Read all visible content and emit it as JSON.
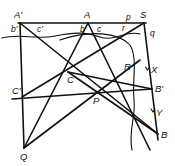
{
  "diagram": {
    "points": {
      "A_prime": {
        "label": "A'",
        "x": 20,
        "y": 23
      },
      "A": {
        "label": "A",
        "x": 88,
        "y": 23
      },
      "S": {
        "label": "S",
        "x": 144,
        "y": 23
      },
      "C": {
        "label": "C",
        "x": 68,
        "y": 72
      },
      "R": {
        "label": "R",
        "x": 122,
        "y": 73
      },
      "P": {
        "label": "P",
        "x": 97,
        "y": 93
      },
      "C_prime": {
        "label": "C'",
        "x": 22,
        "y": 97
      },
      "B_prime": {
        "label": "B'",
        "x": 152,
        "y": 89
      },
      "Q": {
        "label": "Q",
        "x": 24,
        "y": 148
      },
      "B": {
        "label": "B",
        "x": 158,
        "y": 134
      }
    },
    "small_labels": {
      "b_prime": "b'",
      "c_prime": "c'",
      "b": "b",
      "c": "c",
      "r": "r",
      "p": "p",
      "q": "q",
      "X": "X",
      "Y": "Y"
    }
  }
}
